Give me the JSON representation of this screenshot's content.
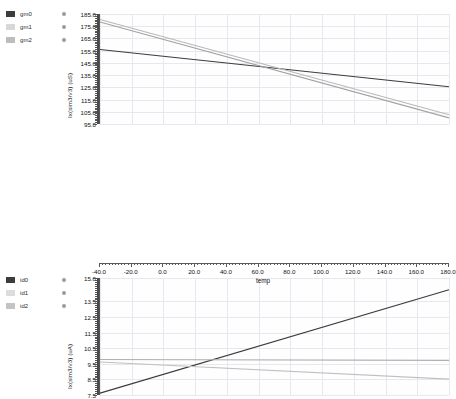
{
  "chart_data": [
    {
      "id": "transconductance",
      "type": "line",
      "title": "",
      "xlabel": "temp",
      "ylabel": "Ix(sim3/v3) (uS)",
      "xlim": [
        -40.0,
        180.0
      ],
      "ylim": [
        95.0,
        185.0
      ],
      "xticks": [
        "-40.0",
        "-20.0",
        "0.0",
        "20.0",
        "40.0",
        "60.0",
        "80.0",
        "100.0",
        "120.0",
        "140.0",
        "160.0",
        "180.0"
      ],
      "yticks": [
        "185.0",
        "175.0",
        "165.0",
        "155.0",
        "145.0",
        "135.0",
        "125.0",
        "115.0",
        "105.0",
        "95.0"
      ],
      "grid": true,
      "legend_position": "left-outside",
      "series": [
        {
          "name": "gm0",
          "color": "#3c3c3c",
          "x": [
            -40.0,
            180.0
          ],
          "values": [
            156.0,
            125.5
          ]
        },
        {
          "name": "gm1",
          "color": "#b9b9b9",
          "x": [
            -40.0,
            180.0
          ],
          "values": [
            180.5,
            102.5
          ]
        },
        {
          "name": "gm2",
          "color": "#a3a3a3",
          "x": [
            -40.0,
            180.0
          ],
          "values": [
            178.5,
            100.0
          ]
        }
      ]
    },
    {
      "id": "drain-current",
      "type": "line",
      "title": "",
      "xlabel": "temp",
      "ylabel": "Ix(sim3/v3) (uA)",
      "xlim": [
        -40.0,
        180.0
      ],
      "ylim": [
        7.5,
        15.0
      ],
      "xticks": [
        "-40.0",
        "-20.0",
        "0.0",
        "20.0",
        "40.0",
        "60.0",
        "80.0",
        "100.0",
        "120.0",
        "140.0",
        "160.0",
        "180.0"
      ],
      "yticks": [
        "15.0",
        "13.5",
        "12.5",
        "11.5",
        "10.5",
        "9.5",
        "8.5",
        "7.5"
      ],
      "grid": true,
      "legend_position": "left-outside",
      "series": [
        {
          "name": "id0",
          "color": "#3c3c3c",
          "x": [
            -40.0,
            180.0
          ],
          "values": [
            7.62,
            14.25
          ]
        },
        {
          "name": "id1",
          "color": "#b0b0b0",
          "x": [
            -40.0,
            180.0
          ],
          "values": [
            9.78,
            9.72
          ]
        },
        {
          "name": "id2",
          "color": "#c0c0c0",
          "x": [
            -40.0,
            180.0
          ],
          "values": [
            9.62,
            8.52
          ]
        }
      ]
    }
  ],
  "legend_top": {
    "items": [
      {
        "label": "gm0",
        "color": "#3c3c3c",
        "marker": "swatch-dark"
      },
      {
        "label": "gm1",
        "color": "#d8d8d8",
        "marker": "swatch-light"
      },
      {
        "label": "gm2",
        "color": "#bdbdbd",
        "marker": "swatch-mid"
      }
    ]
  },
  "legend_bottom": {
    "items": [
      {
        "label": "id0",
        "color": "#3c3c3c",
        "marker": "swatch-dark"
      },
      {
        "label": "id1",
        "color": "#dcdcdc",
        "marker": "swatch-light"
      },
      {
        "label": "id2",
        "color": "#c4c4c4",
        "marker": "swatch-mid"
      }
    ]
  },
  "axes": {
    "xlabel": "temp"
  },
  "colors": {
    "grid": "#e7e7ef",
    "axis": "#555555",
    "text": "#111111",
    "background": "#ffffff"
  }
}
